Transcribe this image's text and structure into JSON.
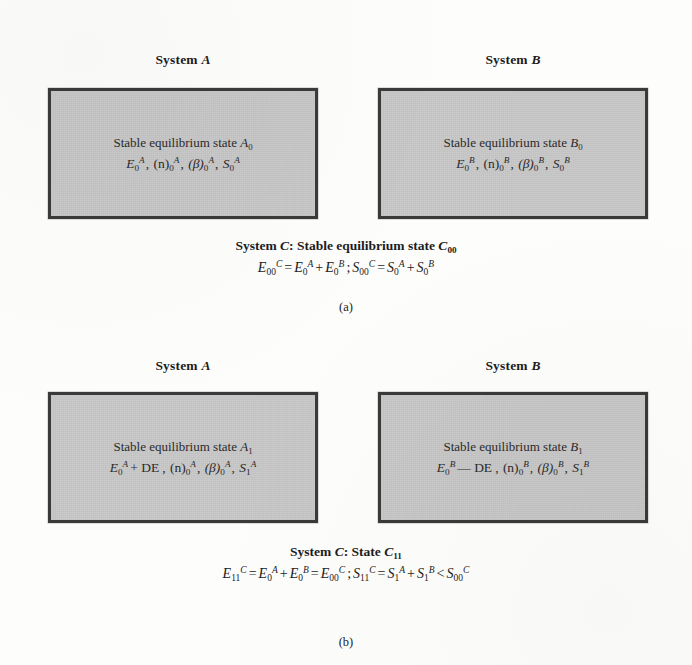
{
  "figure": {
    "type": "thermodynamic-system-diagram",
    "panels": [
      {
        "id": "a",
        "label": "(a)",
        "boxes": [
          {
            "title_prefix": "System",
            "title_symbol": "A",
            "state_text": "Stable equilibrium state",
            "state_symbol": "A",
            "state_subscript": "0",
            "properties": [
              {
                "base": "E",
                "sub": "0",
                "sup": "A"
              },
              {
                "base": "(n)",
                "sub": "0",
                "sup": "A"
              },
              {
                "base": "(β)",
                "sub": "0",
                "sup": "A"
              },
              {
                "base": "S",
                "sub": "0",
                "sup": "A"
              }
            ],
            "property_line": "E₀ᴬ , (n)₀ᴬ , (β)₀ᴬ , S₀ᴬ"
          },
          {
            "title_prefix": "System",
            "title_symbol": "B",
            "state_text": "Stable equilibrium state",
            "state_symbol": "B",
            "state_subscript": "0",
            "properties": [
              {
                "base": "E",
                "sub": "0",
                "sup": "B"
              },
              {
                "base": "(n)",
                "sub": "0",
                "sup": "B"
              },
              {
                "base": "(β)",
                "sub": "0",
                "sup": "B"
              },
              {
                "base": "S",
                "sub": "0",
                "sup": "B"
              }
            ],
            "property_line": "E₀ᴮ , (n)₀ᴮ , (β)₀ᴮ , S₀ᴮ"
          }
        ],
        "caption_title": "System C: Stable equilibrium state C00",
        "caption_title_parts": {
          "prefix": "System",
          "symbol": "C",
          "colon": ":",
          "state_text": "Stable equilibrium state",
          "state_symbol": "C",
          "state_subscript": "00"
        },
        "caption_equation": "E00^C = E0^A + E0^B ; S00^C = S0^A + S0^B"
      },
      {
        "id": "b",
        "label": "(b)",
        "boxes": [
          {
            "title_prefix": "System",
            "title_symbol": "A",
            "state_text": "Stable equilibrium state",
            "state_symbol": "A",
            "state_subscript": "1",
            "properties": [
              {
                "base": "E",
                "sub": "0",
                "sup": "A",
                "suffix": "+ DE"
              },
              {
                "base": "(n)",
                "sub": "0",
                "sup": "A"
              },
              {
                "base": "(β)",
                "sub": "0",
                "sup": "A"
              },
              {
                "base": "S",
                "sub": "1",
                "sup": "A"
              }
            ],
            "property_line": "E₀ᴬ + DE, (n)₀ᴬ , (β)₀ᴬ , S₁ᴬ"
          },
          {
            "title_prefix": "System",
            "title_symbol": "B",
            "state_text": "Stable equilibrium state",
            "state_symbol": "B",
            "state_subscript": "1",
            "properties": [
              {
                "base": "E",
                "sub": "0",
                "sup": "B",
                "suffix": "— DE"
              },
              {
                "base": "(n)",
                "sub": "0",
                "sup": "B"
              },
              {
                "base": "(β)",
                "sub": "0",
                "sup": "B"
              },
              {
                "base": "S",
                "sub": "1",
                "sup": "B"
              }
            ],
            "property_line": "E₀ᴮ — DE, (n)₀ᴮ , (β)₀ᴮ , S₁ᴮ"
          }
        ],
        "caption_title": "System C: State C11",
        "caption_title_parts": {
          "prefix": "System",
          "symbol": "C",
          "colon": ":",
          "state_text": "State",
          "state_symbol": "C",
          "state_subscript": "11"
        },
        "caption_equation": "E11^C = E0^A + E0^B = E00^C ; S11^C = S1^A + S1^B < S00^C"
      }
    ],
    "symbols": {
      "plus": "+",
      "minus": "—",
      "equals": "=",
      "less_than": "<",
      "semicolon": ";",
      "comma": ","
    },
    "colors": {
      "box_fill": "#c9c9c9",
      "box_border": "#3a3a3a",
      "page_background": "#fdfdfc",
      "text": "#1c1c1c"
    }
  }
}
